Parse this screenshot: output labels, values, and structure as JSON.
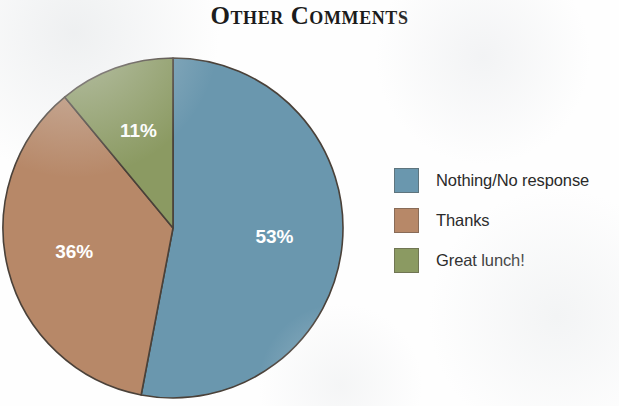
{
  "chart_data": {
    "type": "pie",
    "title": "Other Comments",
    "categories": [
      "Nothing/No response",
      "Thanks",
      "Great lunch!"
    ],
    "values": [
      53,
      36,
      11
    ],
    "value_labels": [
      "53%",
      "36%",
      "11%"
    ],
    "colors": [
      "#6a97ae",
      "#b78868",
      "#8b9a62"
    ],
    "slice_border_color": "#4a4139",
    "label_color": "#ffffff",
    "units": "percent",
    "start_angle_deg": 0,
    "direction": "clockwise",
    "legend_position": "right",
    "grid": false,
    "xlabel": "",
    "ylabel": "",
    "background": "#fefefe"
  },
  "legend": {
    "items": [
      {
        "label": "Nothing/No response",
        "color": "#6a97ae"
      },
      {
        "label": "Thanks",
        "color": "#b78868"
      },
      {
        "label": "Great lunch!",
        "color": "#8b9a62"
      }
    ]
  }
}
